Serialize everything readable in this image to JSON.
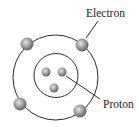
{
  "diagram": {
    "labels": {
      "electron": "Electron",
      "proton": "Proton"
    },
    "colors": {
      "orbit": "#2a2a2a",
      "particle_light": "#d8d8d8",
      "particle_dark": "#6a6a6a",
      "text": "#1a1a1a"
    },
    "counts": {
      "electrons": 4,
      "protons": 3,
      "orbits": 2
    }
  }
}
